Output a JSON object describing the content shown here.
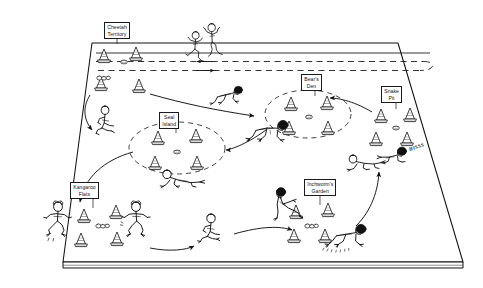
{
  "diagram": {
    "type": "perspective field plan",
    "background_color": "#ffffff",
    "ink_color": "#111111",
    "field": {
      "name": "playing-field",
      "shape": "quadrilateral perspective slab",
      "top_edge_y": 42,
      "bottom_edge_y": 262,
      "slab_thickness_px": 6
    },
    "track": {
      "name": "sprint-lane",
      "style": "dashed",
      "lane_count": 2,
      "direction_markers": [
        "left-arrow",
        "right-arrow"
      ],
      "return_loop": "right end rounded turnaround"
    }
  },
  "stations": [
    {
      "id": "cheetah-territory",
      "label": "Cheetah\nTerritory",
      "label_x": 104,
      "label_y": 25,
      "cone_count": 4,
      "boundary": "none",
      "movement": "sprint",
      "sfx": ""
    },
    {
      "id": "bears-den",
      "label": "Bear's\nDen",
      "label_x": 302,
      "label_y": 76,
      "cone_count": 4,
      "boundary": "dashed-ellipse",
      "movement": "bear crawl",
      "sfx": ""
    },
    {
      "id": "snake-pit",
      "label": "Snake\nPit",
      "label_x": 382,
      "label_y": 88,
      "cone_count": 4,
      "boundary": "none",
      "movement": "slither",
      "sfx": "HISSS"
    },
    {
      "id": "seal-island",
      "label": "Seal\nIsland",
      "label_x": 158,
      "label_y": 114,
      "cone_count": 4,
      "boundary": "dashed-ellipse",
      "movement": "seal crawl",
      "sfx": ""
    },
    {
      "id": "kangaroo-flats",
      "label": "Kangaroo\nFlats",
      "label_x": 67,
      "label_y": 183,
      "cone_count": 4,
      "boundary": "none",
      "movement": "kangaroo jump",
      "sfx": ""
    },
    {
      "id": "inchworms-garden",
      "label": "Inchworm's\nGarden",
      "label_x": 312,
      "label_y": 180,
      "cone_count": 4,
      "boundary": "none",
      "movement": "inchworm walk",
      "sfx": ""
    }
  ],
  "flow_arrows": [
    {
      "from": "cheetah-territory",
      "to": "seal-island-approach",
      "curve": "left descending"
    },
    {
      "from": "cheetah-territory",
      "to": "bears-den",
      "curve": "right descending"
    },
    {
      "from": "seal-island",
      "to": "kangaroo-flats",
      "curve": "long left sweep"
    },
    {
      "from": "bears-den",
      "to": "seal-island",
      "curve": "right to left"
    },
    {
      "from": "snake-pit",
      "to": "bears-den",
      "curve": "upper right"
    },
    {
      "from": "inchworms-garden",
      "to": "snake-pit",
      "curve": "rising right"
    },
    {
      "from": "kangaroo-flats",
      "to": "bottom-center",
      "curve": "low right"
    },
    {
      "from": "bottom-center",
      "to": "inchworms-garden",
      "curve": "low right"
    }
  ],
  "figures": [
    {
      "id": "cheetah-runner-1",
      "pose": "sprinting",
      "x": 212,
      "y": 35
    },
    {
      "id": "cheetah-runner-2",
      "pose": "sprinting",
      "x": 196,
      "y": 55
    },
    {
      "id": "seal-crawler-1",
      "pose": "seal crawl",
      "x": 104,
      "y": 110
    },
    {
      "id": "bear-crawler-1",
      "pose": "bear crawl",
      "x": 222,
      "y": 92
    },
    {
      "id": "bear-crawler-2",
      "pose": "bear crawl",
      "x": 272,
      "y": 128
    },
    {
      "id": "seal-crawler-2",
      "pose": "seal crawl",
      "x": 180,
      "y": 172
    },
    {
      "id": "snake-slither-1",
      "pose": "slither",
      "x": 378,
      "y": 158
    },
    {
      "id": "snake-slither-2",
      "pose": "slither",
      "x": 412,
      "y": 152
    },
    {
      "id": "kangaroo-jumper-1",
      "pose": "kangaroo jump",
      "x": 58,
      "y": 222
    },
    {
      "id": "kangaroo-jumper-2",
      "pose": "kangaroo jump",
      "x": 131,
      "y": 222
    },
    {
      "id": "seal-crawler-3",
      "pose": "seal crawl",
      "x": 213,
      "y": 228
    },
    {
      "id": "inchworm-walker-1",
      "pose": "inchworm",
      "x": 290,
      "y": 196
    },
    {
      "id": "inchworm-walker-2",
      "pose": "inchworm",
      "x": 352,
      "y": 240
    }
  ]
}
